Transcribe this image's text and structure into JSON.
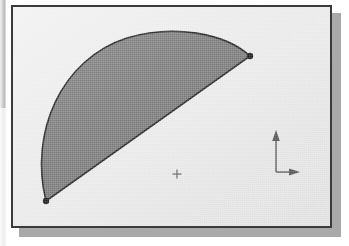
{
  "application": {
    "name": "cad-viewport",
    "window_title": "",
    "background_color": "#e9e9e9",
    "frame_color": "#3a3a3a",
    "shadow_color": "#a9a9a9"
  },
  "viewport": {
    "label": "graphics-window",
    "canvas_color": "#eaeaea",
    "width": 321,
    "height": 223
  },
  "drawing": {
    "object_name": "half-disk-segment",
    "description": "Closed region bounded by a circular arc and its chord",
    "fill_color": "#7d7d7d",
    "outline_color": "#2b2b2b",
    "outline_width": 1.6,
    "geometry": {
      "type": "arc-and-chord",
      "start_point": {
        "x": 33,
        "y": 194,
        "label": "P1"
      },
      "end_point": {
        "x": 237,
        "y": 49,
        "label": "P2"
      },
      "arc_apex": {
        "x": 128,
        "y": 28,
        "label": "arc-midpoint"
      },
      "chord_midpoint": {
        "x": 135,
        "y": 121
      },
      "arc_sweep_degrees": 180,
      "path": "M 33 194 C 16 126 48 52 114 31 C 160 17 212 26 237 49 L 33 194 Z"
    },
    "nodes": [
      {
        "name": "node-start",
        "x": 33,
        "y": 194,
        "radius": 3.2,
        "color": "#1e1e1e"
      },
      {
        "name": "node-end",
        "x": 237,
        "y": 49,
        "radius": 3.2,
        "color": "#1e1e1e"
      }
    ]
  },
  "blip_marker": {
    "name": "blip-mark",
    "symbol": "+",
    "x": 164,
    "y": 167,
    "size": 9,
    "color": "#6a6a6a"
  },
  "ucs_icon": {
    "name": "ucs-coordinate-icon",
    "origin": {
      "x": 263,
      "y": 165
    },
    "color": "#555555",
    "y_axis": {
      "label": "",
      "length": 42,
      "direction": "up"
    },
    "x_axis": {
      "label": "",
      "length": 24,
      "direction": "right"
    }
  }
}
